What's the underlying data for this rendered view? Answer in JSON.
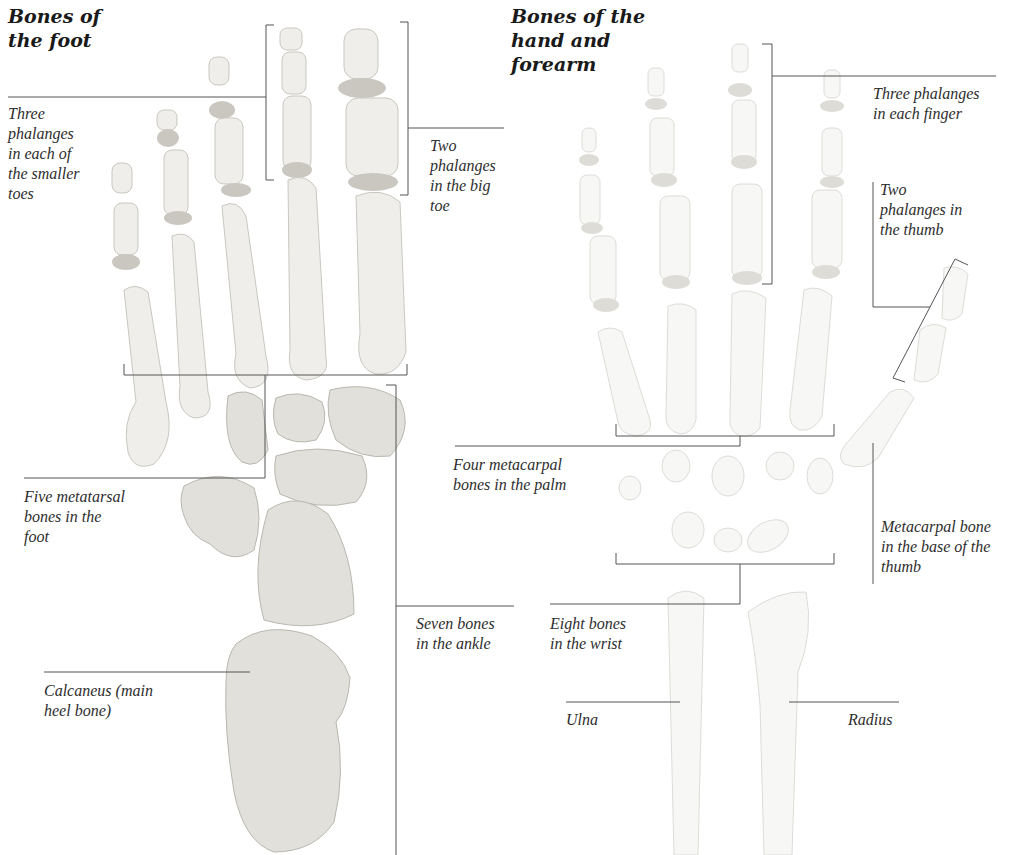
{
  "foot": {
    "title": "Bones of\nthe foot",
    "labels": {
      "phalanges_smaller_toes": "Three\nphalanges\nin each of\nthe smaller\ntoes",
      "phalanges_big_toe": "Two\nphalanges\nin the big\ntoe",
      "metatarsals": "Five metatarsal\nbones in the\nfoot",
      "ankle": "Seven bones\nin the ankle",
      "calcaneus": "Calcaneus (main\nheel bone)"
    }
  },
  "hand": {
    "title": "Bones of the\nhand and\nforearm",
    "labels": {
      "phalanges_finger": "Three phalanges\nin each finger",
      "phalanges_thumb": "Two\nphalanges in\nthe thumb",
      "metacarpals_palm": "Four metacarpal\nbones in the palm",
      "metacarpal_thumb": "Metacarpal bone\nin the base of the\nthumb",
      "wrist": "Eight bones\nin the wrist",
      "ulna": "Ulna",
      "radius": "Radius"
    }
  },
  "colors": {
    "background": "#ffffff",
    "leader_line": "#555555",
    "foot_bone": "#efeeea",
    "hand_bone": "#f7f7f5",
    "text": "#2d2d2d"
  }
}
